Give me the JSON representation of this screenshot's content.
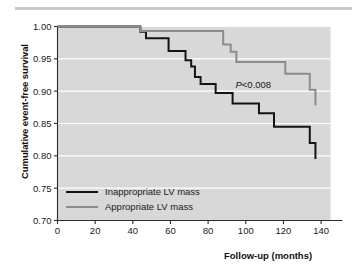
{
  "figure": {
    "top_rule": "horizontal-rule"
  },
  "chart_data": {
    "type": "line",
    "subtype": "kaplan-meier-step",
    "title": "",
    "xlabel": "Follow-up (months)",
    "ylabel": "Cumulative event-free survival",
    "xlim": [
      0,
      145
    ],
    "ylim": [
      0.7,
      1.0
    ],
    "xticks": [
      0,
      20,
      40,
      60,
      80,
      100,
      120,
      140
    ],
    "xtick_labels": [
      "0",
      "20",
      "40",
      "60",
      "80",
      "100",
      "120",
      "140"
    ],
    "yticks": [
      0.7,
      0.75,
      0.8,
      0.85,
      0.9,
      0.95,
      1.0
    ],
    "ytick_labels": [
      "0.70",
      "0.75",
      "0.80",
      "0.85",
      "0.90",
      "0.95",
      "1.00"
    ],
    "grid": "horizontal-white-gridlines",
    "plot_background": "#d8d8d8",
    "legend_position": "lower-left-inside",
    "annotations": [
      {
        "name": "p-value",
        "text_italic": "P",
        "text_rest": "<0.008",
        "x": 104,
        "y": 0.905
      }
    ],
    "series": [
      {
        "name": "Inappropriate LV mass",
        "color": "#141414",
        "width": 2.0,
        "points": [
          [
            0,
            1.0
          ],
          [
            44,
            1.0
          ],
          [
            44,
            0.992
          ],
          [
            47,
            0.992
          ],
          [
            47,
            0.982
          ],
          [
            59,
            0.982
          ],
          [
            59,
            0.962
          ],
          [
            68,
            0.962
          ],
          [
            68,
            0.948
          ],
          [
            71,
            0.948
          ],
          [
            71,
            0.938
          ],
          [
            73,
            0.938
          ],
          [
            73,
            0.922
          ],
          [
            76,
            0.922
          ],
          [
            76,
            0.911
          ],
          [
            84,
            0.911
          ],
          [
            84,
            0.897
          ],
          [
            93,
            0.897
          ],
          [
            93,
            0.881
          ],
          [
            107,
            0.881
          ],
          [
            107,
            0.866
          ],
          [
            115,
            0.866
          ],
          [
            115,
            0.845
          ],
          [
            134,
            0.845
          ],
          [
            134,
            0.82
          ],
          [
            137,
            0.82
          ],
          [
            137,
            0.795
          ]
        ]
      },
      {
        "name": "Appropriate LV mass",
        "color": "#8c8c8c",
        "width": 2.0,
        "points": [
          [
            0,
            1.0
          ],
          [
            44,
            1.0
          ],
          [
            44,
            0.993
          ],
          [
            88,
            0.993
          ],
          [
            88,
            0.972
          ],
          [
            92,
            0.972
          ],
          [
            92,
            0.961
          ],
          [
            95,
            0.961
          ],
          [
            95,
            0.945
          ],
          [
            121,
            0.945
          ],
          [
            121,
            0.927
          ],
          [
            134,
            0.927
          ],
          [
            134,
            0.902
          ],
          [
            137,
            0.902
          ],
          [
            137,
            0.878
          ]
        ]
      }
    ]
  }
}
